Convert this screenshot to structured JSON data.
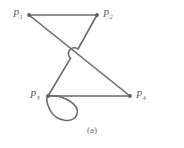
{
  "figure": {
    "caption": "(a)",
    "stroke_color": "#6a6a6a",
    "node_color": "#5e5e5e",
    "label_color": "#5e5e5e",
    "background_color": "#ffffff"
  },
  "graph": {
    "nodes": [
      {
        "id": "P1",
        "label_p": "P",
        "label_sub": "1",
        "x": 29,
        "y": 15
      },
      {
        "id": "P2",
        "label_p": "P",
        "label_sub": "2",
        "x": 97,
        "y": 15
      },
      {
        "id": "P3",
        "label_p": "P",
        "label_sub": "3",
        "x": 48,
        "y": 96
      },
      {
        "id": "P4",
        "label_p": "P",
        "label_sub": "4",
        "x": 130,
        "y": 96
      }
    ],
    "edges": [
      {
        "id": "e-p1-p2",
        "from": "P1",
        "to": "P2",
        "style": "straight"
      },
      {
        "id": "e-p1-p4",
        "from": "P1",
        "to": "P4",
        "style": "straight"
      },
      {
        "id": "e-p2-p3",
        "from": "P2",
        "to": "P3",
        "style": "hop-over-crossing"
      },
      {
        "id": "e-p3-p4",
        "from": "P3",
        "to": "P4",
        "style": "straight"
      },
      {
        "id": "e-p3-p3",
        "from": "P3",
        "to": "P3",
        "style": "self-loop"
      }
    ],
    "crossing": {
      "x": 73,
      "y": 57
    }
  }
}
